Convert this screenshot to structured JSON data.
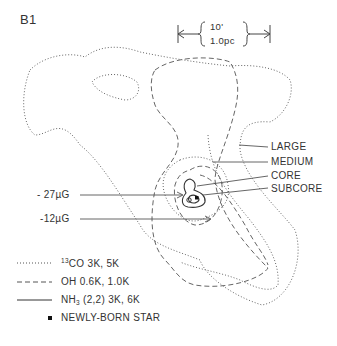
{
  "panel_label": "B1",
  "scale_bar": {
    "angle": "10'",
    "distance": "1.0pc"
  },
  "region_labels": [
    "LARGE",
    "MEDIUM",
    "CORE",
    "SUBCORE"
  ],
  "field_labels": [
    "- 27µG",
    "-12µG"
  ],
  "legend": [
    {
      "style": "dotted",
      "prefix_sup": "13",
      "text": "CO 3K, 5K"
    },
    {
      "style": "dashed",
      "text": "OH 0.6K, 1.0K"
    },
    {
      "style": "solid",
      "text_main": "NH",
      "text_sub": "3",
      "text_rest": " (2,2) 3K, 6K"
    },
    {
      "style": "square-marker",
      "text": "NEWLY-BORN STAR"
    }
  ],
  "colors": {
    "line": "#555555",
    "text": "#333333",
    "background": "#ffffff"
  }
}
